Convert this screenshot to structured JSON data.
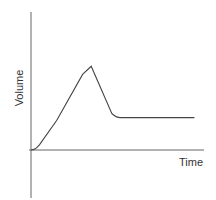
{
  "chart_data": {
    "type": "line",
    "title": "",
    "xlabel": "Time",
    "ylabel": "Volume",
    "grid": false,
    "legend": null,
    "ticks": {
      "x": [],
      "y": []
    },
    "xlim": [
      0,
      1
    ],
    "ylim": [
      0,
      1
    ],
    "series": [
      {
        "name": "Volume",
        "color": "#444444",
        "x": [
          0.0,
          0.05,
          0.15,
          0.3,
          0.35,
          0.47,
          0.52,
          0.57,
          0.95
        ],
        "y": [
          0.0,
          0.04,
          0.22,
          0.56,
          0.62,
          0.27,
          0.24,
          0.24,
          0.24
        ]
      }
    ]
  },
  "colors": {
    "axis": "#555555",
    "line": "#444444",
    "text": "#333333"
  }
}
